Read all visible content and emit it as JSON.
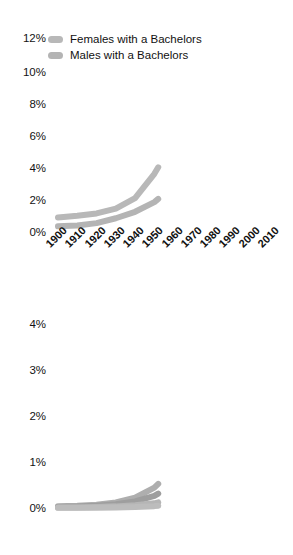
{
  "figure": {
    "background": "#ffffff",
    "text_color": "#131313"
  },
  "charts": [
    {
      "id": "bachelors-chart",
      "yticks": [
        "0%",
        "2%",
        "4%",
        "6%",
        "8%",
        "10%",
        "12%"
      ],
      "xticks": [
        "1900",
        "1910",
        "1920",
        "1930",
        "1940",
        "1950",
        "1960",
        "1970",
        "1980",
        "1990",
        "2000",
        "2010"
      ],
      "legend": [
        {
          "label": "Females with a Bachelors",
          "color": "#b8b8b8"
        },
        {
          "label": "Males with a Bachelors",
          "color": "#b4b4b4"
        }
      ]
    },
    {
      "id": "advanced-degrees-chart",
      "yticks": [
        "0%",
        "1%",
        "2%",
        "3%",
        "4%"
      ],
      "xticks": [
        "1900",
        "1910",
        "1920",
        "1930",
        "1940",
        "1950",
        "1960",
        "1970",
        "1980",
        "1990",
        "2000",
        "2010"
      ],
      "legend": [
        {
          "label": "Females with a Doctorate",
          "color": "#bcbcbc"
        },
        {
          "label": "Males with a Doctorate",
          "color": "#b5b5b5"
        },
        {
          "label": "Females with a Masters",
          "color": "#9e9e9e"
        },
        {
          "label": "Males with a Masters",
          "color": "#aeaeae"
        }
      ]
    }
  ],
  "chart_data": [
    {
      "type": "line",
      "title": "",
      "xlabel": "",
      "ylabel": "",
      "xlim": [
        1900,
        2010
      ],
      "ylim": [
        0,
        12
      ],
      "yunit": "%",
      "grid": false,
      "legend_position": "top-left",
      "x": [
        1900,
        1910,
        1920,
        1930,
        1940,
        1950,
        1952
      ],
      "series": [
        {
          "name": "Males with a Bachelors",
          "color": "#b8b8b8",
          "values": [
            0.9,
            1.0,
            1.15,
            1.45,
            2.1,
            3.6,
            4.0
          ]
        },
        {
          "name": "Females with a Bachelors",
          "color": "#b4b4b4",
          "values": [
            0.35,
            0.4,
            0.55,
            0.85,
            1.25,
            1.85,
            2.05
          ]
        }
      ]
    },
    {
      "type": "line",
      "title": "",
      "xlabel": "",
      "ylabel": "",
      "xlim": [
        1900,
        2010
      ],
      "ylim": [
        0,
        4
      ],
      "yunit": "%",
      "grid": false,
      "legend_position": "top-left",
      "x": [
        1900,
        1910,
        1920,
        1930,
        1940,
        1950,
        1952
      ],
      "series": [
        {
          "name": "Males with a Masters",
          "color": "#aeaeae",
          "values": [
            0.04,
            0.05,
            0.07,
            0.12,
            0.22,
            0.44,
            0.52
          ]
        },
        {
          "name": "Females with a Masters",
          "color": "#9e9e9e",
          "values": [
            0.02,
            0.03,
            0.05,
            0.08,
            0.14,
            0.26,
            0.31
          ]
        },
        {
          "name": "Males with a Doctorate",
          "color": "#b5b5b5",
          "values": [
            0.01,
            0.012,
            0.02,
            0.035,
            0.06,
            0.1,
            0.12
          ]
        },
        {
          "name": "Females with a Doctorate",
          "color": "#bcbcbc",
          "values": [
            0.003,
            0.004,
            0.006,
            0.01,
            0.02,
            0.04,
            0.05
          ]
        }
      ]
    }
  ]
}
